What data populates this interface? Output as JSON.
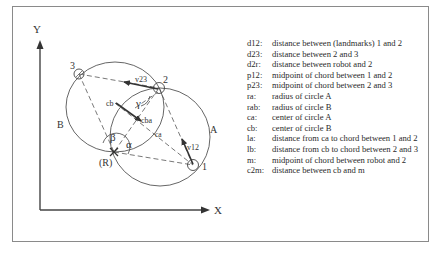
{
  "diagram": {
    "axes": {
      "x_label": "X",
      "y_label": "Y"
    },
    "points": {
      "p1": "1",
      "p2": "2",
      "p3": "3",
      "robot": "(R)"
    },
    "circles": {
      "a": "A",
      "b": "B"
    },
    "vectors": {
      "v12": "v12",
      "v23": "v23"
    },
    "centers": {
      "ca": "ca",
      "cb": "cb",
      "cba": "cba"
    },
    "angles": {
      "alpha": "α",
      "beta": "β",
      "gamma": "γ"
    }
  },
  "legend": [
    {
      "key": "d12:",
      "value": "distance between (landmarks) 1 and 2"
    },
    {
      "key": "d23:",
      "value": "distance between 2 and 3"
    },
    {
      "key": "d2r:",
      "value": "distance between robot and 2"
    },
    {
      "key": "p12:",
      "value": "midpoint of chord between 1 and 2"
    },
    {
      "key": "p23:",
      "value": "midpoint of chord between 2 and 3"
    },
    {
      "key": "ra:",
      "value": "radius of circle A"
    },
    {
      "key": "rab:",
      "value": "radius of circle B"
    },
    {
      "key": "ca:",
      "value": "center of circle A"
    },
    {
      "key": "cb:",
      "value": "center of circle B"
    },
    {
      "key": "la:",
      "value": "distance from ca to chord between 1 and 2"
    },
    {
      "key": "lb:",
      "value": "distance from cb to chord between 2 and 3"
    },
    {
      "key": "m:",
      "value": "midpoint of chord between robot and 2"
    },
    {
      "key": "c2m:",
      "value": "distance between cb and m"
    }
  ]
}
